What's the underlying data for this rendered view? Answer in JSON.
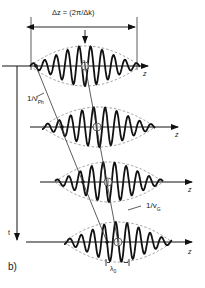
{
  "figure": {
    "panel_label": "b)",
    "delta_z_label": "Δz = (2π/Δk)",
    "phase_velocity_label": "1/v",
    "phase_velocity_sub": "Ph",
    "group_velocity_label": "1/v",
    "group_velocity_sub": "G",
    "time_axis_label": "t",
    "space_axis_label": "z",
    "wavelength_label": "λ",
    "wavelength_sub": "0",
    "packets": [
      {
        "axis_y": 66,
        "x_start": 30,
        "x_end": 140,
        "center_x": 85,
        "phase_dot_x": 36
      },
      {
        "axis_y": 127,
        "x_start": 42,
        "x_end": 155,
        "center_x": 97,
        "phase_dot_x": 62
      },
      {
        "axis_y": 182,
        "x_start": 55,
        "x_end": 163,
        "center_x": 108,
        "phase_dot_x": 83
      },
      {
        "axis_y": 242,
        "x_start": 64,
        "x_end": 172,
        "center_x": 118,
        "phase_dot_x": 107
      }
    ]
  }
}
